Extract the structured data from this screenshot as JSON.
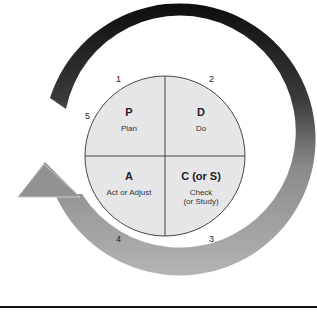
{
  "diagram": {
    "quadrants": [
      {
        "letter": "P",
        "label": "Plan",
        "label2": ""
      },
      {
        "letter": "D",
        "label": "Do",
        "label2": ""
      },
      {
        "letter": "A",
        "label": "Act or Adjust",
        "label2": ""
      },
      {
        "letter": "C (or S)",
        "label": "Check",
        "label2": "(or Study)"
      }
    ],
    "step_numbers": [
      "1",
      "2",
      "3",
      "4",
      "5"
    ],
    "colors": {
      "circle_fill": "#e6e6e9",
      "arrow_dark": "#111111",
      "arrow_light": "#a8a8a8",
      "rule": "#111111"
    }
  }
}
